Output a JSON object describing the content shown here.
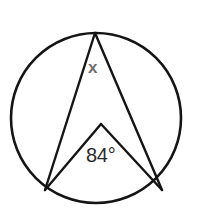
{
  "figure": {
    "kind": "circle-geometry-diagram",
    "canvas": {
      "width": 199,
      "height": 221,
      "background": "#ffffff"
    },
    "stroke_color": "#151515",
    "circle": {
      "name": "circumscribed-circle",
      "center_x": 96,
      "center_y": 118,
      "radius": 85,
      "stroke_width": 2.6
    },
    "points": {
      "apex": {
        "label": "apex-on-circle",
        "x": 95,
        "y": 33
      },
      "left_base": {
        "label": "left-point-on-circle",
        "x": 45,
        "y": 190
      },
      "right_base": {
        "label": "right-point-on-circle",
        "x": 162,
        "y": 190
      },
      "inner_vertex": {
        "label": "center-vertex",
        "x": 101,
        "y": 124
      }
    },
    "chords": [
      {
        "name": "chord-apex-to-left-base",
        "from": "apex",
        "to": "left_base",
        "stroke_width": 2.4
      },
      {
        "name": "chord-apex-to-right-base",
        "from": "apex",
        "to": "right_base",
        "stroke_width": 2.4
      },
      {
        "name": "radius-inner-to-left-base",
        "from": "inner_vertex",
        "to": "left_base",
        "stroke_width": 2.4
      },
      {
        "name": "radius-inner-to-right-base",
        "from": "inner_vertex",
        "to": "right_base",
        "stroke_width": 2.4
      }
    ],
    "labels": {
      "inscribed_angle": {
        "text": "x",
        "color": "#6e6e6e",
        "x": 95,
        "y": 68,
        "meaning": "unknown-inscribed-angle-at-apex"
      },
      "central_angle": {
        "text": "84°",
        "color": "#2b2b2b",
        "x": 104,
        "y": 158,
        "meaning": "known-central-angle-at-center"
      }
    }
  }
}
